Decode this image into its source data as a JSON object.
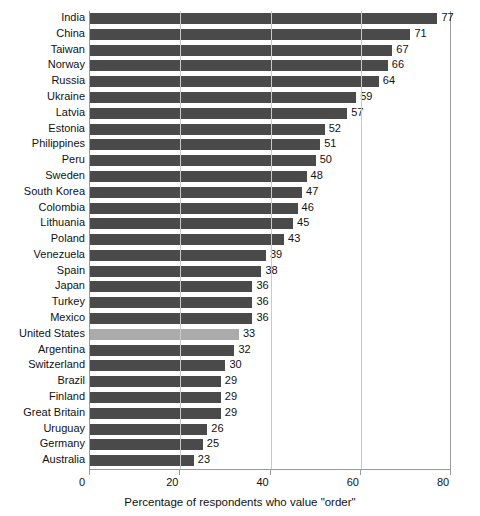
{
  "chart_data": {
    "type": "bar",
    "orientation": "horizontal",
    "title": "",
    "xlabel": "Percentage of respondents who value \"order\"",
    "ylabel": "",
    "xlim": [
      0,
      80
    ],
    "xticks": [
      0,
      20,
      40,
      60,
      80
    ],
    "grid": true,
    "legend": false,
    "highlight_category": "United States",
    "categories": [
      "India",
      "China",
      "Taiwan",
      "Norway",
      "Russia",
      "Ukraine",
      "Latvia",
      "Estonia",
      "Philippines",
      "Peru",
      "Sweden",
      "South Korea",
      "Colombia",
      "Lithuania",
      "Poland",
      "Venezuela",
      "Spain",
      "Japan",
      "Turkey",
      "Mexico",
      "United States",
      "Argentina",
      "Switzerland",
      "Brazil",
      "Finland",
      "Great Britain",
      "Uruguay",
      "Germany",
      "Australia"
    ],
    "values": [
      77,
      71,
      67,
      66,
      64,
      59,
      57,
      52,
      51,
      50,
      48,
      47,
      46,
      45,
      43,
      39,
      38,
      36,
      36,
      36,
      33,
      32,
      30,
      29,
      29,
      29,
      26,
      25,
      23
    ]
  },
  "colors": {
    "bar": "#4a4a4a",
    "bar_highlight": "#ababab",
    "axis": "#9a9a9a",
    "grid": "#c9c9c9",
    "text": "#111111",
    "background": "#ffffff"
  },
  "cropped_caption": {
    "left_sliver": "",
    "right_sliver": ""
  }
}
